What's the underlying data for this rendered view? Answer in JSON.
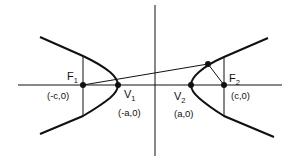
{
  "diagram": {
    "colors": {
      "stroke": "#111111",
      "background": "#ffffff"
    },
    "axes": {
      "x_axis": {
        "y": 85,
        "x1": 40,
        "x2": 282
      },
      "y_axis": {
        "x": 155,
        "y1": 5,
        "y2": 156
      }
    },
    "points": [
      {
        "id": "F1",
        "name": "F",
        "sub": "1",
        "coord": "(-c,0)",
        "x": 83,
        "y": 85
      },
      {
        "id": "V1",
        "name": "V",
        "sub": "1",
        "coord": "(-a,0)",
        "x": 118,
        "y": 85
      },
      {
        "id": "V2",
        "name": "V",
        "sub": "2",
        "coord": "(a,0)",
        "x": 191,
        "y": 85
      },
      {
        "id": "F2",
        "name": "F",
        "sub": "2",
        "coord": "(c,0)",
        "x": 224,
        "y": 85
      },
      {
        "id": "P",
        "name": "",
        "sub": "",
        "coord": "",
        "x": 208,
        "y": 64
      }
    ],
    "segments": [
      {
        "id": "PF1",
        "from": "P",
        "to": "F1"
      },
      {
        "id": "PF2",
        "from": "P",
        "to": "F2"
      }
    ],
    "branches": [
      "left",
      "right"
    ],
    "latus_recta": [
      "F1",
      "F2"
    ]
  }
}
